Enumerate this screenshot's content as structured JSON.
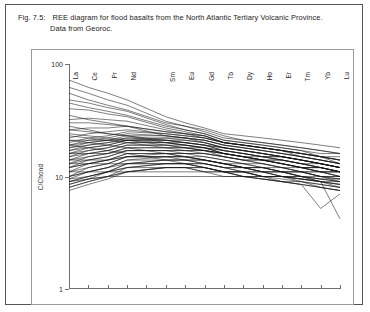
{
  "caption": {
    "tag": "Fig. 7.5:",
    "line1": "REE diagram for flood basalts from the North Atlantic Tertiary Volcanic Province.",
    "line2": "Data from Georoc."
  },
  "chart_data": {
    "type": "line",
    "title": "REE diagram for flood basalts from the North Atlantic Tertiary Volcanic Province",
    "xlabel": "",
    "ylabel": "C/Chond",
    "yscale": "log",
    "ylim": [
      1,
      100
    ],
    "ytick_labels": [
      "100",
      "10",
      "1"
    ],
    "ytick_values": [
      100,
      10,
      1
    ],
    "grid": false,
    "legend": "none",
    "x_categories": [
      "La",
      "Ce",
      "Pr",
      "Nd",
      "Pm",
      "Sm",
      "Eu",
      "Gd",
      "Tb",
      "Dy",
      "Ho",
      "Er",
      "Tm",
      "Yb",
      "Lu"
    ],
    "x_tick_labels": [
      "La",
      "Ce",
      "Pr",
      "Nd",
      "",
      "Sm",
      "Eu",
      "Gd",
      "Tb",
      "Dy",
      "Ho",
      "Er",
      "Tm",
      "Yb",
      "Lu"
    ],
    "note": "Pm position is ticked but unlabeled; all samples have a gap at Pm.",
    "series": [
      {
        "name": "sample-01",
        "values": [
          72,
          62,
          55,
          48,
          null,
          34,
          30,
          27,
          24,
          23,
          22,
          21,
          20,
          19,
          18
        ]
      },
      {
        "name": "sample-02",
        "values": [
          62,
          55,
          48,
          43,
          null,
          31,
          28,
          25,
          22,
          21,
          20,
          19,
          18,
          17,
          16
        ]
      },
      {
        "name": "sample-03",
        "values": [
          48,
          45,
          41,
          38,
          null,
          29,
          26,
          24,
          21,
          20,
          19,
          18,
          17,
          16,
          16
        ]
      },
      {
        "name": "sample-04",
        "values": [
          40,
          39,
          36,
          34,
          null,
          27,
          25,
          23,
          20,
          19,
          18,
          17,
          16,
          15,
          15
        ]
      },
      {
        "name": "sample-05",
        "values": [
          32,
          33,
          32,
          31,
          null,
          26,
          24,
          23,
          20,
          19,
          18,
          17,
          16,
          15,
          14
        ]
      },
      {
        "name": "sample-06",
        "values": [
          26,
          27,
          27,
          28,
          null,
          25,
          24,
          23,
          20,
          19,
          18,
          17,
          16,
          15,
          14
        ]
      },
      {
        "name": "sample-07",
        "values": [
          22,
          24,
          25,
          26,
          null,
          24,
          23,
          22,
          20,
          19,
          18,
          17,
          16,
          15,
          14
        ]
      },
      {
        "name": "sample-08",
        "values": [
          20,
          22,
          23,
          25,
          null,
          24,
          23,
          22,
          20,
          19,
          18,
          17,
          16,
          15,
          13
        ]
      },
      {
        "name": "sample-09",
        "values": [
          19,
          21,
          22,
          24,
          null,
          23,
          22,
          21,
          19,
          18,
          17,
          16,
          15,
          14,
          13
        ]
      },
      {
        "name": "sample-10",
        "values": [
          18,
          20,
          21,
          23,
          null,
          23,
          22,
          21,
          19,
          18,
          17,
          16,
          15,
          14,
          13
        ]
      },
      {
        "name": "sample-11",
        "values": [
          17,
          19,
          20,
          22,
          null,
          22,
          21,
          20,
          18,
          17,
          16,
          15,
          14,
          13,
          12
        ]
      },
      {
        "name": "sample-12",
        "values": [
          17,
          18,
          19,
          21,
          null,
          21,
          21,
          20,
          18,
          17,
          16,
          15,
          14,
          13,
          12
        ]
      },
      {
        "name": "sample-13",
        "values": [
          16,
          18,
          19,
          21,
          null,
          21,
          20,
          19,
          18,
          17,
          16,
          15,
          14,
          13,
          12
        ]
      },
      {
        "name": "sample-14",
        "values": [
          16,
          17,
          18,
          20,
          null,
          20,
          20,
          19,
          17,
          16,
          15,
          15,
          14,
          13,
          12
        ]
      },
      {
        "name": "sample-15",
        "values": [
          15,
          17,
          18,
          20,
          null,
          20,
          19,
          18,
          17,
          16,
          15,
          14,
          13,
          12,
          11
        ]
      },
      {
        "name": "sample-16",
        "values": [
          15,
          16,
          17,
          19,
          null,
          19,
          19,
          18,
          16,
          15,
          14,
          14,
          13,
          12,
          11
        ]
      },
      {
        "name": "sample-17",
        "values": [
          14,
          16,
          17,
          19,
          null,
          19,
          18,
          18,
          16,
          15,
          14,
          13,
          12,
          12,
          11
        ]
      },
      {
        "name": "sample-18",
        "values": [
          14,
          15,
          16,
          18,
          null,
          18,
          18,
          17,
          16,
          15,
          14,
          13,
          12,
          11,
          11
        ]
      },
      {
        "name": "sample-19",
        "values": [
          13,
          15,
          16,
          18,
          null,
          18,
          17,
          17,
          15,
          14,
          14,
          13,
          12,
          11,
          10
        ]
      },
      {
        "name": "sample-20",
        "values": [
          13,
          14,
          15,
          17,
          null,
          17,
          17,
          16,
          15,
          14,
          13,
          12,
          12,
          11,
          10
        ]
      },
      {
        "name": "sample-21",
        "values": [
          12,
          14,
          15,
          17,
          null,
          17,
          16,
          16,
          15,
          14,
          13,
          12,
          11,
          10,
          10
        ]
      },
      {
        "name": "sample-22",
        "values": [
          12,
          13,
          14,
          16,
          null,
          16,
          16,
          15,
          14,
          13,
          13,
          12,
          11,
          10,
          9.5
        ]
      },
      {
        "name": "sample-23",
        "values": [
          11,
          13,
          14,
          16,
          null,
          16,
          15,
          15,
          14,
          13,
          12,
          11,
          11,
          10,
          9
        ]
      },
      {
        "name": "sample-24",
        "values": [
          11,
          12,
          13,
          15,
          null,
          15,
          15,
          14,
          13,
          12,
          12,
          11,
          10,
          9.5,
          9
        ]
      },
      {
        "name": "sample-25",
        "values": [
          10,
          12,
          13,
          15,
          null,
          15,
          15,
          14,
          13,
          12,
          11,
          11,
          10,
          9.5,
          9
        ]
      },
      {
        "name": "sample-26",
        "values": [
          10,
          11,
          12,
          14,
          null,
          15,
          14,
          14,
          13,
          12,
          11,
          10,
          10,
          9,
          8.5
        ]
      },
      {
        "name": "sample-27",
        "values": [
          9.5,
          11,
          12,
          14,
          null,
          14,
          14,
          13,
          12,
          12,
          11,
          10,
          9.5,
          9,
          8.5
        ]
      },
      {
        "name": "sample-28",
        "values": [
          9,
          10,
          11,
          13,
          null,
          14,
          14,
          13,
          12,
          11,
          11,
          10,
          9.5,
          9,
          8
        ]
      },
      {
        "name": "sample-29",
        "values": [
          9,
          10,
          11,
          13,
          null,
          13,
          13,
          13,
          12,
          11,
          10,
          10,
          9,
          8.5,
          8
        ]
      },
      {
        "name": "sample-30",
        "values": [
          8.5,
          9.5,
          11,
          12,
          null,
          13,
          13,
          12,
          11,
          11,
          10,
          9.5,
          9,
          8.5,
          8
        ]
      },
      {
        "name": "sample-31",
        "values": [
          8,
          9,
          10,
          12,
          null,
          12,
          12,
          12,
          11,
          10,
          10,
          9,
          9,
          8,
          7.5
        ]
      },
      {
        "name": "sample-32",
        "values": [
          8,
          9,
          10,
          11,
          null,
          12,
          12,
          11,
          11,
          10,
          9.5,
          9,
          8.5,
          8,
          7.5
        ]
      },
      {
        "name": "sample-33",
        "values": [
          19,
          18,
          17,
          16,
          null,
          14,
          13,
          12,
          11,
          11,
          10,
          10,
          9.5,
          9,
          9
        ]
      },
      {
        "name": "sample-34",
        "values": [
          21,
          20,
          19,
          18,
          null,
          16,
          15,
          14,
          13,
          12,
          12,
          11,
          11,
          10,
          10
        ]
      },
      {
        "name": "sample-35",
        "values": [
          11,
          11,
          11,
          11,
          null,
          11,
          11,
          11,
          11,
          11,
          11,
          11,
          11,
          11,
          11
        ]
      },
      {
        "name": "sample-36",
        "values": [
          9,
          9.5,
          10,
          10,
          null,
          10,
          10,
          10,
          10,
          10,
          10,
          10,
          10,
          9.5,
          9.5
        ]
      },
      {
        "name": "sample-37",
        "values": [
          18,
          19,
          20,
          21,
          null,
          22,
          22,
          21,
          19,
          18,
          17,
          16,
          15,
          14,
          13
        ]
      },
      {
        "name": "sample-38",
        "values": [
          30,
          30,
          29,
          28,
          null,
          25,
          24,
          22,
          20,
          19,
          18,
          17,
          15,
          14,
          13
        ]
      },
      {
        "name": "sample-39",
        "values": [
          45,
          41,
          38,
          35,
          null,
          28,
          26,
          24,
          21,
          20,
          19,
          18,
          17,
          15,
          14
        ]
      },
      {
        "name": "sample-40",
        "values": [
          14,
          14,
          14,
          15,
          null,
          15,
          15,
          14,
          13,
          12,
          12,
          11,
          10,
          9,
          4.2
        ]
      },
      {
        "name": "sample-41",
        "values": [
          13,
          13,
          13,
          13,
          null,
          13,
          13,
          12,
          11,
          10,
          9.5,
          9,
          8.5,
          5.2,
          7.0
        ]
      },
      {
        "name": "sample-42",
        "values": [
          7.5,
          8.5,
          9.5,
          11,
          null,
          12,
          12,
          11,
          10,
          10,
          9.5,
          9,
          8.5,
          8,
          7.5
        ]
      },
      {
        "name": "sample-43",
        "values": [
          24,
          23,
          22,
          21,
          null,
          19,
          18,
          17,
          16,
          15,
          14,
          13,
          12,
          12,
          11
        ]
      },
      {
        "name": "sample-44",
        "values": [
          28,
          26,
          24,
          23,
          null,
          20,
          19,
          18,
          16,
          15,
          14,
          14,
          13,
          12,
          11
        ]
      },
      {
        "name": "sample-45",
        "values": [
          35,
          32,
          30,
          28,
          null,
          23,
          22,
          20,
          18,
          17,
          16,
          15,
          14,
          13,
          12
        ]
      },
      {
        "name": "sample-46",
        "values": [
          10,
          11,
          12,
          13,
          null,
          14,
          14,
          14,
          13,
          13,
          12,
          12,
          11,
          11,
          10
        ]
      },
      {
        "name": "sample-47",
        "values": [
          12,
          13,
          14,
          15,
          null,
          16,
          16,
          16,
          15,
          14,
          14,
          13,
          12,
          12,
          11
        ]
      },
      {
        "name": "sample-48",
        "values": [
          16,
          16,
          16,
          17,
          null,
          17,
          17,
          17,
          16,
          15,
          15,
          14,
          13,
          13,
          12
        ]
      },
      {
        "name": "sample-49",
        "values": [
          21,
          21,
          21,
          21,
          null,
          20,
          19,
          18,
          17,
          16,
          15,
          14,
          13,
          12,
          11
        ]
      },
      {
        "name": "sample-50",
        "values": [
          26,
          25,
          24,
          23,
          null,
          21,
          20,
          19,
          17,
          16,
          15,
          15,
          14,
          13,
          12
        ]
      },
      {
        "name": "sample-51",
        "values": [
          9.5,
          10,
          11,
          12,
          null,
          13,
          13,
          13,
          12,
          12,
          11,
          11,
          10,
          10,
          9.5
        ]
      },
      {
        "name": "sample-52",
        "values": [
          8.5,
          9.5,
          10,
          11,
          null,
          12,
          12,
          12,
          11,
          11,
          10,
          10,
          9.5,
          9,
          8.5
        ]
      },
      {
        "name": "sample-53",
        "values": [
          55,
          48,
          43,
          39,
          null,
          30,
          28,
          26,
          23,
          21,
          20,
          19,
          18,
          17,
          16
        ]
      },
      {
        "name": "sample-54",
        "values": [
          19,
          20,
          21,
          22,
          null,
          21,
          20,
          19,
          18,
          17,
          16,
          15,
          14,
          13,
          12
        ]
      },
      {
        "name": "sample-55",
        "values": [
          23,
          22,
          21,
          20,
          null,
          18,
          18,
          17,
          16,
          15,
          14,
          13,
          12,
          11,
          11
        ]
      }
    ]
  }
}
